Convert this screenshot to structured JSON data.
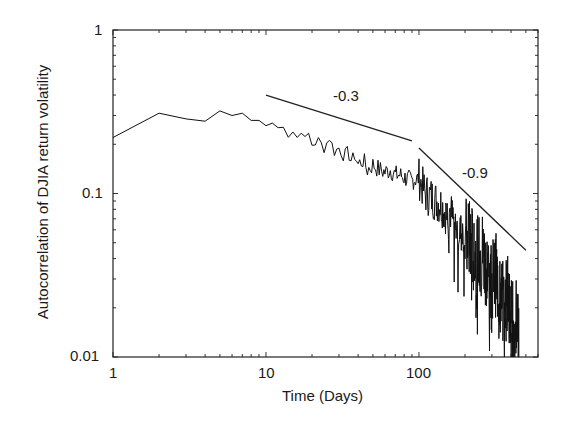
{
  "chart_data": {
    "type": "line",
    "title": "",
    "xlabel": "Time (Days)",
    "ylabel": "Autocorrelation of DJIA return volatility",
    "xscale": "log",
    "yscale": "log",
    "xlim": [
      1,
      600
    ],
    "ylim": [
      0.01,
      1
    ],
    "x_ticks": [
      {
        "value": 1,
        "label": "1"
      },
      {
        "value": 10,
        "label": "10"
      },
      {
        "value": 100,
        "label": "100"
      }
    ],
    "y_ticks": [
      {
        "value": 0.01,
        "label": "0.01"
      },
      {
        "value": 0.1,
        "label": "0.1"
      },
      {
        "value": 1,
        "label": "1"
      }
    ],
    "grid": false,
    "legend": null,
    "series": [
      {
        "name": "DJIA volatility autocorrelation",
        "color": "#000000",
        "x": [
          1,
          2,
          3,
          4,
          5,
          6,
          7,
          8,
          9,
          10,
          11,
          12,
          13,
          14,
          15,
          16,
          17,
          18,
          19,
          20,
          22,
          24,
          26,
          28,
          30,
          32,
          34,
          36,
          38,
          40,
          43,
          46,
          50,
          55,
          60,
          65,
          70,
          75,
          80,
          90,
          100,
          110,
          120,
          130,
          140,
          150,
          160,
          170,
          180,
          200,
          220,
          240,
          260,
          280,
          300,
          320,
          340,
          360,
          380,
          400,
          420,
          440,
          450
        ],
        "values": [
          0.22,
          0.31,
          0.286,
          0.277,
          0.32,
          0.3,
          0.31,
          0.28,
          0.28,
          0.26,
          0.27,
          0.25,
          0.27,
          0.23,
          0.24,
          0.22,
          0.25,
          0.21,
          0.23,
          0.2,
          0.21,
          0.19,
          0.22,
          0.18,
          0.19,
          0.17,
          0.18,
          0.16,
          0.17,
          0.15,
          0.16,
          0.14,
          0.15,
          0.14,
          0.135,
          0.14,
          0.13,
          0.13,
          0.125,
          0.12,
          0.124,
          0.1,
          0.095,
          0.09,
          0.085,
          0.075,
          0.08,
          0.065,
          0.06,
          0.055,
          0.05,
          0.04,
          0.045,
          0.035,
          0.03,
          0.032,
          0.025,
          0.02,
          0.025,
          0.018,
          0.015,
          0.02,
          0.012
        ]
      }
    ],
    "annotations": [
      {
        "type": "slope_line",
        "label": "-0.3",
        "slope": -0.3,
        "from": {
          "x": 10,
          "y": 0.4
        },
        "to": {
          "x": 90,
          "y": 0.21
        }
      },
      {
        "type": "slope_line",
        "label": "-0.9",
        "slope": -0.9,
        "from": {
          "x": 100,
          "y": 0.19
        },
        "to": {
          "x": 500,
          "y": 0.045
        }
      }
    ]
  }
}
